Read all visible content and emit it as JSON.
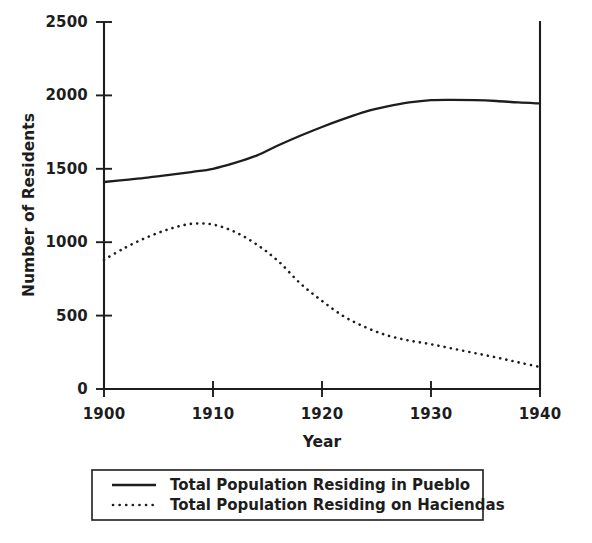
{
  "chart_data": {
    "type": "line",
    "title": "",
    "xlabel": "Year",
    "ylabel": "Number of Residents",
    "xlim": [
      1900,
      1940
    ],
    "ylim": [
      0,
      2500
    ],
    "xticks": [
      1900,
      1910,
      1920,
      1930,
      1940
    ],
    "yticks": [
      0,
      500,
      1000,
      1500,
      2000,
      2500
    ],
    "xtick_labels": [
      "1900",
      "1910",
      "1920",
      "1930",
      "1940"
    ],
    "ytick_labels": [
      "0",
      "500",
      "1000",
      "1500",
      "2000",
      "2500"
    ],
    "grid": false,
    "legend_position": "below-axes",
    "series": [
      {
        "name": "Total Population Residing in Pueblo",
        "style": "solid",
        "color": "#1d1d1d",
        "x": [
          1900,
          1902,
          1904,
          1906,
          1908,
          1910,
          1912,
          1914,
          1916,
          1918,
          1920,
          1922,
          1924,
          1926,
          1928,
          1930,
          1932,
          1934,
          1936,
          1938,
          1940
        ],
        "values": [
          1410,
          1425,
          1440,
          1458,
          1478,
          1500,
          1540,
          1590,
          1660,
          1725,
          1785,
          1840,
          1890,
          1925,
          1952,
          1968,
          1970,
          1968,
          1962,
          1952,
          1945
        ]
      },
      {
        "name": "Total Population Residing on Haciendas",
        "style": "dotted",
        "color": "#1d1d1d",
        "x": [
          1900,
          1902,
          1904,
          1906,
          1908,
          1910,
          1912,
          1914,
          1916,
          1918,
          1920,
          1922,
          1924,
          1926,
          1928,
          1930,
          1932,
          1934,
          1936,
          1938,
          1940
        ],
        "values": [
          880,
          965,
          1035,
          1090,
          1125,
          1120,
          1070,
          985,
          870,
          720,
          600,
          495,
          420,
          365,
          330,
          305,
          275,
          245,
          215,
          182,
          150
        ]
      }
    ]
  },
  "legend": {
    "entries": [
      {
        "label": "Total Population Residing in Pueblo",
        "style": "solid"
      },
      {
        "label": "Total Population Residing on Haciendas",
        "style": "dotted"
      }
    ]
  },
  "axis_titles": {
    "x": "Year",
    "y": "Number of Residents"
  }
}
